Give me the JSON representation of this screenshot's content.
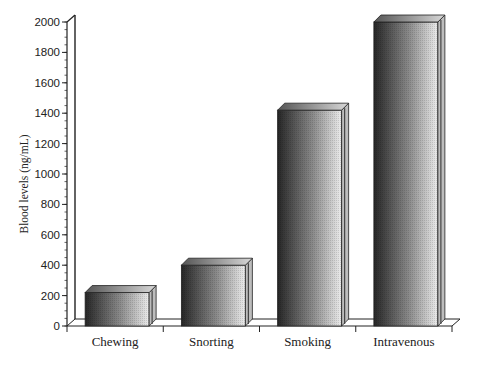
{
  "chart_data": {
    "type": "bar",
    "title": "",
    "xlabel": "",
    "ylabel": "Blood levels (ng/mL)",
    "categories": [
      "Chewing",
      "Snorting",
      "Smoking",
      "Intravenous"
    ],
    "values": [
      220,
      400,
      1420,
      2000
    ],
    "ylim": [
      0,
      2000
    ],
    "yticks": [
      0,
      200,
      400,
      600,
      800,
      1000,
      1200,
      1400,
      1600,
      1800,
      2000
    ],
    "grid": false,
    "legend": null,
    "style": "3d-shaded-grayscale"
  },
  "colors": {
    "bar_dark": "#2a2a2a",
    "bar_light": "#e8e8e8",
    "axis": "#222222"
  }
}
